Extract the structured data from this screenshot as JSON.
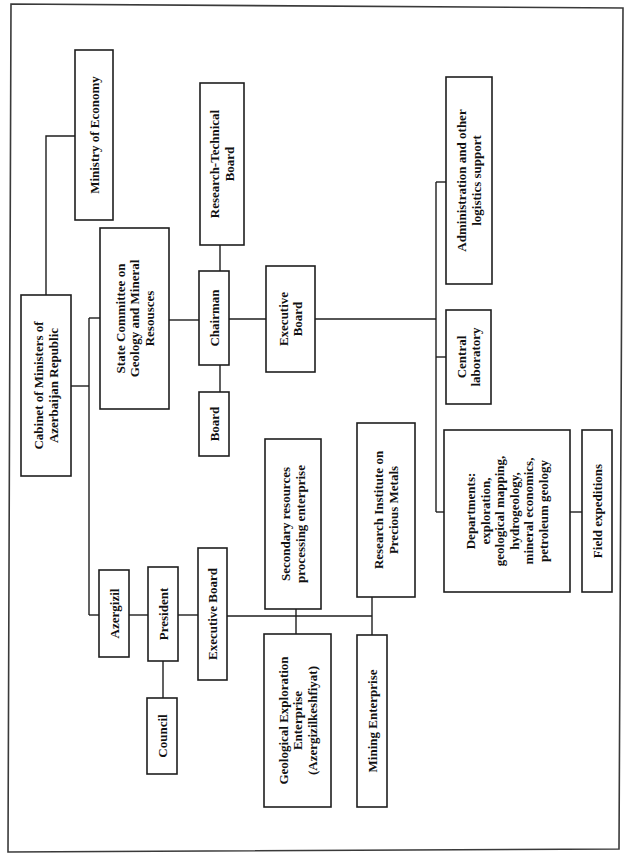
{
  "diagram": {
    "type": "organizational-chart",
    "orientation": "rotated-90-ccw",
    "nodes": [
      {
        "id": "cabinet",
        "lines": [
          "Cabinet of Ministers of",
          "Azerbaijan Republic"
        ]
      },
      {
        "id": "ministry_economy",
        "lines": [
          "Ministry of Economy"
        ]
      },
      {
        "id": "state_committee",
        "lines": [
          "State Committee on",
          "Geology and Mineral",
          "Resousces"
        ]
      },
      {
        "id": "chairman",
        "lines": [
          "Chairman"
        ]
      },
      {
        "id": "research_technical_board",
        "lines": [
          "Research-Technical",
          "Board"
        ]
      },
      {
        "id": "board",
        "lines": [
          "Board"
        ]
      },
      {
        "id": "executive_board_sc",
        "lines": [
          "Executive",
          "Board"
        ]
      },
      {
        "id": "administration",
        "lines": [
          "Administration and other",
          "logistics support"
        ]
      },
      {
        "id": "central_lab",
        "lines": [
          "Central",
          "laboratory"
        ]
      },
      {
        "id": "departments",
        "lines": [
          "Departments:",
          "exploration,",
          "geological mapping,",
          "hydrogeology,",
          "mineral economics,",
          "petroleum geology"
        ]
      },
      {
        "id": "field_expeditions",
        "lines": [
          "Field expeditions"
        ]
      },
      {
        "id": "azergizil",
        "lines": [
          "Azergizil"
        ]
      },
      {
        "id": "president",
        "lines": [
          "President"
        ]
      },
      {
        "id": "council",
        "lines": [
          "Council"
        ]
      },
      {
        "id": "executive_board_az",
        "lines": [
          "Executive Board"
        ]
      },
      {
        "id": "secondary_resources",
        "lines": [
          "Secondary resources",
          "processing enterprise"
        ]
      },
      {
        "id": "geological_exploration",
        "lines": [
          "Geological Exploration",
          "Enterprise",
          "(Azergizilkeshfiyat)"
        ]
      },
      {
        "id": "research_institute",
        "lines": [
          "Research Institute on",
          "Precious Metals"
        ]
      },
      {
        "id": "mining_enterprise",
        "lines": [
          "Mining Enterprise"
        ]
      }
    ],
    "edges": [
      [
        "cabinet",
        "ministry_economy"
      ],
      [
        "cabinet",
        "state_committee"
      ],
      [
        "cabinet",
        "azergizil"
      ],
      [
        "state_committee",
        "chairman"
      ],
      [
        "chairman",
        "research_technical_board"
      ],
      [
        "chairman",
        "board"
      ],
      [
        "chairman",
        "executive_board_sc"
      ],
      [
        "executive_board_sc",
        "administration"
      ],
      [
        "executive_board_sc",
        "central_lab"
      ],
      [
        "executive_board_sc",
        "departments"
      ],
      [
        "departments",
        "field_expeditions"
      ],
      [
        "azergizil",
        "president"
      ],
      [
        "president",
        "council"
      ],
      [
        "president",
        "executive_board_az"
      ],
      [
        "executive_board_az",
        "secondary_resources"
      ],
      [
        "executive_board_az",
        "geological_exploration"
      ],
      [
        "executive_board_az",
        "research_institute"
      ],
      [
        "executive_board_az",
        "mining_enterprise"
      ]
    ]
  }
}
